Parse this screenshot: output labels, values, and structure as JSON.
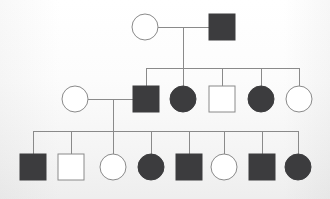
{
  "figure": {
    "kind": "pedigree-chart",
    "width": 330,
    "height": 199,
    "background_color": "#fdfdfd",
    "line_color": "#8a8a8a",
    "affected_fill": "#3c3c3e",
    "unaffected_fill": "#ffffff",
    "symbol_stroke": "#8a8a8a",
    "symbol_size": 26,
    "generation_count": 3
  },
  "chart_data": {
    "type": "diagram",
    "title": "",
    "legend": [
      {
        "key": "square",
        "meaning": "male"
      },
      {
        "key": "circle",
        "meaning": "female"
      },
      {
        "key": "filled",
        "meaning": "affected"
      },
      {
        "key": "open",
        "meaning": "unaffected"
      }
    ],
    "generations": [
      {
        "id": "I",
        "y": 27,
        "individuals": [
          {
            "id": "I-1",
            "shape": "circle",
            "sex": "female",
            "status": "unaffected",
            "filled": false,
            "x": 145,
            "y": 27,
            "size": 26
          },
          {
            "id": "I-2",
            "shape": "square",
            "sex": "male",
            "status": "affected",
            "filled": true,
            "x": 222,
            "y": 27,
            "size": 26
          }
        ]
      },
      {
        "id": "II",
        "y": 99,
        "individuals": [
          {
            "id": "II-0",
            "shape": "circle",
            "sex": "female",
            "status": "unaffected",
            "filled": false,
            "x": 75,
            "y": 99,
            "size": 26,
            "role": "spouse"
          },
          {
            "id": "II-1",
            "shape": "square",
            "sex": "male",
            "status": "affected",
            "filled": true,
            "x": 146,
            "y": 99,
            "size": 26
          },
          {
            "id": "II-2",
            "shape": "circle",
            "sex": "female",
            "status": "affected",
            "filled": true,
            "x": 183,
            "y": 99,
            "size": 26
          },
          {
            "id": "II-3",
            "shape": "square",
            "sex": "male",
            "status": "unaffected",
            "filled": false,
            "x": 222,
            "y": 99,
            "size": 26
          },
          {
            "id": "II-4",
            "shape": "circle",
            "sex": "female",
            "status": "affected",
            "filled": true,
            "x": 261,
            "y": 99,
            "size": 26
          },
          {
            "id": "II-5",
            "shape": "circle",
            "sex": "female",
            "status": "unaffected",
            "filled": false,
            "x": 299,
            "y": 99,
            "size": 26
          }
        ]
      },
      {
        "id": "III",
        "y": 167,
        "individuals": [
          {
            "id": "III-1",
            "shape": "square",
            "sex": "male",
            "status": "affected",
            "filled": true,
            "x": 33,
            "y": 167,
            "size": 26
          },
          {
            "id": "III-2",
            "shape": "square",
            "sex": "male",
            "status": "unaffected",
            "filled": false,
            "x": 71,
            "y": 167,
            "size": 26
          },
          {
            "id": "III-3",
            "shape": "circle",
            "sex": "female",
            "status": "unaffected",
            "filled": false,
            "x": 113,
            "y": 167,
            "size": 26
          },
          {
            "id": "III-4",
            "shape": "circle",
            "sex": "female",
            "status": "affected",
            "filled": true,
            "x": 151,
            "y": 167,
            "size": 26
          },
          {
            "id": "III-5",
            "shape": "square",
            "sex": "male",
            "status": "affected",
            "filled": true,
            "x": 189,
            "y": 167,
            "size": 26
          },
          {
            "id": "III-6",
            "shape": "circle",
            "sex": "female",
            "status": "unaffected",
            "filled": false,
            "x": 224,
            "y": 167,
            "size": 26
          },
          {
            "id": "III-7",
            "shape": "square",
            "sex": "male",
            "status": "affected",
            "filled": true,
            "x": 262,
            "y": 167,
            "size": 26
          },
          {
            "id": "III-8",
            "shape": "circle",
            "sex": "female",
            "status": "affected",
            "filled": true,
            "x": 298,
            "y": 167,
            "size": 26
          }
        ]
      }
    ],
    "matings": [
      {
        "id": "mating-I",
        "partners": [
          "I-1",
          "I-2"
        ],
        "mating_line": {
          "x1": 158,
          "x2": 209,
          "y": 27
        },
        "descent_x": 183,
        "descent_y1": 27,
        "descent_y2": 68,
        "sibship_bar": {
          "y": 68,
          "x1": 146,
          "x2": 299
        },
        "children": [
          "II-1",
          "II-2",
          "II-3",
          "II-4",
          "II-5"
        ],
        "child_drop_y1": 68,
        "child_drop_y2": 86
      },
      {
        "id": "mating-II",
        "partners": [
          "II-0",
          "II-1"
        ],
        "mating_line": {
          "x1": 88,
          "x2": 133,
          "y": 99
        },
        "descent_x": 113,
        "descent_y1": 99,
        "descent_y2": 131,
        "sibship_bar": {
          "y": 131,
          "x1": 33,
          "x2": 298
        },
        "children": [
          "III-1",
          "III-2",
          "III-3",
          "III-4",
          "III-5",
          "III-6",
          "III-7",
          "III-8"
        ],
        "child_drop_y1": 131,
        "child_drop_y2": 154
      }
    ]
  }
}
